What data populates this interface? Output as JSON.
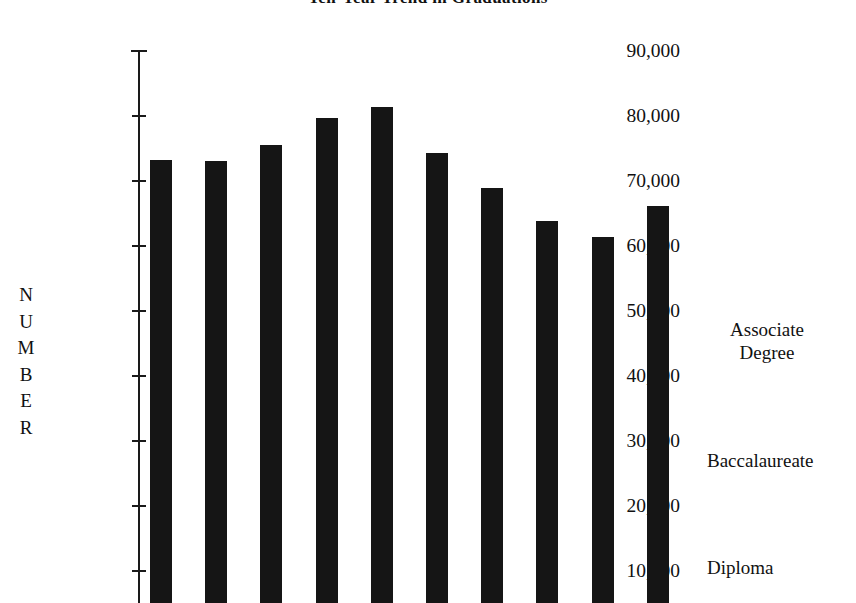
{
  "chart_data": {
    "type": "bar",
    "title": "Ten-Year Trend in Graduations",
    "xlabel": "",
    "ylabel": "NUMBER",
    "ylabel_letters": [
      "N",
      "U",
      "M",
      "B",
      "E",
      "R"
    ],
    "ylim": [
      0,
      90000
    ],
    "ytick_labels": [
      "90,000",
      "80,000",
      "70,000",
      "60,000",
      "50,000",
      "40,000",
      "30,000",
      "20,000",
      "10,000"
    ],
    "ytick_values": [
      90000,
      80000,
      70000,
      60000,
      50000,
      40000,
      30000,
      20000,
      10000
    ],
    "grid": false,
    "legend_position": "right",
    "categories": [
      "1",
      "2",
      "3",
      "4",
      "5",
      "6",
      "7",
      "8",
      "9",
      "10"
    ],
    "values": [
      73200,
      73100,
      75500,
      79700,
      81400,
      74300,
      68900,
      63900,
      61400,
      66200
    ],
    "series": [
      {
        "name": "Graduations",
        "values": [
          73200,
          73100,
          75500,
          79700,
          81400,
          74300,
          68900,
          63900,
          61400,
          66200
        ]
      }
    ],
    "annotations": [
      "Associate Degree",
      "Baccalaureate",
      "Diploma"
    ],
    "bar_color": "#151515",
    "axis_color": "#1a1a1a",
    "background_color": "#ffffff"
  },
  "side_labels": [
    {
      "line1": "Associate",
      "line2": "Degree"
    },
    {
      "line1": "Baccalaureate",
      "line2": ""
    },
    {
      "line1": "Diploma",
      "line2": ""
    }
  ]
}
